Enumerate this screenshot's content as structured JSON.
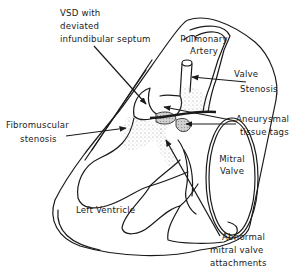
{
  "diagram": {
    "type": "anatomical-line-drawing",
    "labels": {
      "vsd": {
        "line1": "VSD with",
        "line2": "deviated",
        "line3": "infundibular septum"
      },
      "pulmonary_artery": {
        "line1": "Pulmonary",
        "line2": "Artery"
      },
      "valve_stenosis": {
        "line1": "Valve",
        "line2": "Stenosis"
      },
      "fibromuscular_stenosis": {
        "line1": "Fibromuscular",
        "line2": "stenosis"
      },
      "aneurysmal_tissue_tags": {
        "line1": "Aneurysmal",
        "line2": "tissue tags"
      },
      "mitral_valve": {
        "line1": "Mitral",
        "line2": "Valve"
      },
      "left_ventricle": {
        "text": "Left Ventricle"
      },
      "abnormal_attachments": {
        "line1": "Abnormal",
        "line2": "mitral valve",
        "line3": "attachments"
      }
    },
    "colors": {
      "ink": "#1a1a1a",
      "background": "#ffffff",
      "stipple": "#777777",
      "tag_fill": "#bdbdbd"
    }
  }
}
